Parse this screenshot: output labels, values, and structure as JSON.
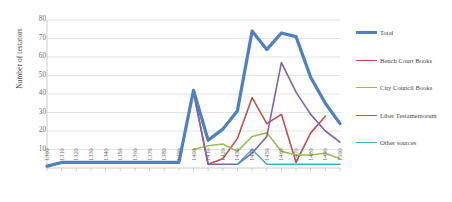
{
  "chart_data": {
    "type": "line",
    "title": "",
    "xlabel": "",
    "ylabel": "Number of testators",
    "ylim": [
      0,
      80
    ],
    "ytick_step": 10,
    "grid": true,
    "legend_position": "right",
    "categories": [
      "1300",
      "1310",
      "1320",
      "1330",
      "1340",
      "1350",
      "1360",
      "1370",
      "1380",
      "1390",
      "1400",
      "1410",
      "1420",
      "1430",
      "1440",
      "1450",
      "1460",
      "1470",
      "1480",
      "1490",
      "1500"
    ],
    "yticks": [
      "80",
      "70",
      "60",
      "50",
      "40",
      "30",
      "20",
      "10"
    ],
    "series": [
      {
        "name": "Total",
        "color": "#4f81bd",
        "values": [
          1,
          3,
          3,
          3,
          3,
          3,
          3,
          3,
          3,
          3,
          42,
          15,
          21,
          31,
          74,
          64,
          73,
          71,
          49,
          35,
          24
        ]
      },
      {
        "name": "Bench Court Books",
        "color": "#c0504d",
        "values": [
          1,
          3,
          3,
          3,
          3,
          3,
          3,
          3,
          3,
          3,
          41,
          2,
          5,
          16,
          38,
          24,
          29,
          3,
          19,
          28,
          null
        ]
      },
      {
        "name": "City Council Books",
        "color": "#9bbb59",
        "values": [
          null,
          null,
          null,
          null,
          null,
          null,
          null,
          null,
          null,
          null,
          10,
          12,
          13,
          9,
          17,
          19,
          9,
          7,
          7,
          8,
          5
        ]
      },
      {
        "name": "Liber Testamentorum",
        "color": "#8064a2",
        "values": [
          null,
          null,
          null,
          null,
          null,
          null,
          null,
          null,
          null,
          null,
          41,
          2,
          2,
          2,
          8,
          17,
          57,
          41,
          29,
          20,
          14
        ]
      },
      {
        "name": "Other sources",
        "color": "#4bacc6",
        "values": [
          null,
          null,
          null,
          null,
          null,
          null,
          null,
          null,
          null,
          null,
          null,
          null,
          null,
          2,
          10,
          2,
          2,
          2,
          2,
          2,
          2
        ]
      }
    ],
    "legend": [
      {
        "label": "Total",
        "color": "#4f81bd",
        "width": 3.2
      },
      {
        "label": "Bench Court Books",
        "color": "#c0504d",
        "width": 1.6
      },
      {
        "label": "City Council Books",
        "color": "#9bbb59",
        "width": 1.6
      },
      {
        "label": "Liber Testamentorum",
        "color": "#8064a2",
        "width": 1.6
      },
      {
        "label": "Other sources",
        "color": "#4bacc6",
        "width": 1.6
      }
    ],
    "colors": {
      "grid": "#d9d9d9",
      "axis": "#bfbfbf",
      "text": "#6b6b6b",
      "background": "#ffffff"
    }
  }
}
